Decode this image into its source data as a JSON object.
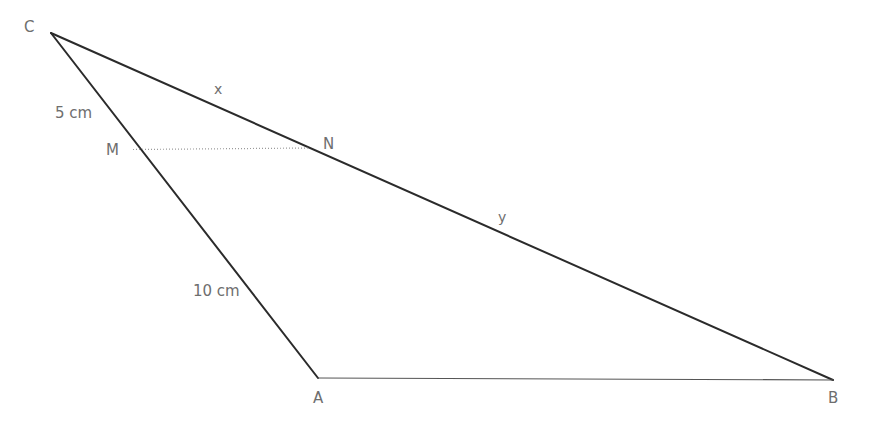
{
  "canvas": {
    "width": 870,
    "height": 421,
    "background": "#ffffff"
  },
  "style": {
    "solid_line_color": "#2b2b2b",
    "thin_line_color": "#555555",
    "dotted_line_color": "#9a9a9a",
    "label_color": "#6e6e6e",
    "solid_line_width": 2,
    "thin_line_width": 1,
    "dotted_line_width": 1
  },
  "diagram": {
    "type": "geometry-triangle",
    "vertices": [
      {
        "id": "C",
        "label": "C",
        "x": 51,
        "y": 33,
        "label_x": 24,
        "label_y": 20
      },
      {
        "id": "A",
        "label": "A",
        "x": 318,
        "y": 378,
        "label_x": 313,
        "label_y": 391
      },
      {
        "id": "B",
        "label": "B",
        "x": 833,
        "y": 380,
        "label_x": 828,
        "label_y": 391
      },
      {
        "id": "M",
        "label": "M",
        "x": 133,
        "y": 150,
        "label_x": 106,
        "label_y": 143
      },
      {
        "id": "N",
        "label": "N",
        "x": 309,
        "y": 148,
        "label_x": 323,
        "label_y": 137
      }
    ],
    "segments": [
      {
        "id": "CB",
        "from": "C",
        "to": "B",
        "style": "solid",
        "note": "side of triangle through N"
      },
      {
        "id": "CA",
        "from": "C",
        "to": "A",
        "style": "solid",
        "note": "side of triangle through M"
      },
      {
        "id": "AB",
        "from": "A",
        "to": "B",
        "style": "thin",
        "note": "base of triangle"
      },
      {
        "id": "MN",
        "from": "M",
        "to": "N",
        "style": "dotted",
        "note": "segment parallel to AB"
      }
    ],
    "annotations": [
      {
        "id": "cm-label",
        "text": "5 cm",
        "x": 55,
        "y": 106,
        "kind": "measure",
        "applies_to": "CM"
      },
      {
        "id": "ma-label",
        "text": "10 cm",
        "x": 193,
        "y": 284,
        "kind": "measure",
        "applies_to": "MA"
      },
      {
        "id": "x-label",
        "text": "x",
        "x": 214,
        "y": 82,
        "kind": "segment",
        "applies_to": "CN"
      },
      {
        "id": "y-label",
        "text": "y",
        "x": 498,
        "y": 210,
        "kind": "segment",
        "applies_to": "NB"
      }
    ]
  }
}
